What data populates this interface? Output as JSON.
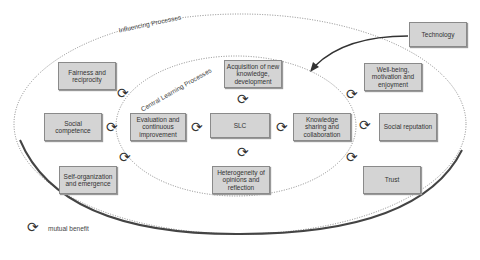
{
  "diagram": {
    "outer_label": "Influencing Processes",
    "inner_label": "Central Learning Processes",
    "center": "SLC",
    "central_nodes": {
      "top": "Acquisition of new knowledge, development",
      "left": "Evaluation and continuous improvement",
      "right": "Knowledge sharing and collaboration",
      "bottom": "Heterogeneity of opinions and reflection"
    },
    "influencing_nodes": {
      "fairness": "Fairness and reciprocity",
      "social_competence": "Social competence",
      "self_org": "Self-organization and emergence",
      "wellbeing": "Well-being, motivation and enjoyment",
      "social_reputation": "Social reputation",
      "trust": "Trust"
    },
    "external_node": "Technology",
    "legend": {
      "icon": "cycle-arrows-icon",
      "label": "mutual benefit"
    }
  }
}
